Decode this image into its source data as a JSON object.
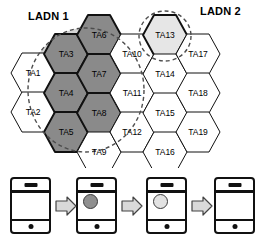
{
  "figure": {
    "type": "cellular-tracking-area-diagram",
    "ladn_labels": [
      {
        "id": "ladn1",
        "text": "LADN 1"
      },
      {
        "id": "ladn2",
        "text": "LADN 2"
      }
    ],
    "colors": {
      "ladn1_fill": "#8a8a8a",
      "ladn2_fill": "#e6e6e6",
      "hex_stroke": "#111111",
      "hex_fill": "#ffffff",
      "dashed_stroke": "#555555",
      "arrow_fill": "#d9d9d9",
      "arrow_stroke": "#444444"
    },
    "hexagons": [
      {
        "label": "TA1",
        "cx": 33,
        "cy": 73,
        "fill": "white",
        "bold": false
      },
      {
        "label": "TA2",
        "cx": 33,
        "cy": 112,
        "fill": "white",
        "bold": false
      },
      {
        "label": "TA3",
        "cx": 66,
        "cy": 54,
        "fill": "ladn1",
        "bold": true
      },
      {
        "label": "TA4",
        "cx": 66,
        "cy": 93,
        "fill": "ladn1",
        "bold": true
      },
      {
        "label": "TA5",
        "cx": 66,
        "cy": 132,
        "fill": "ladn1",
        "bold": true
      },
      {
        "label": "TA6",
        "cx": 99,
        "cy": 35,
        "fill": "ladn1",
        "bold": true
      },
      {
        "label": "TA7",
        "cx": 99,
        "cy": 74,
        "fill": "ladn1",
        "bold": true
      },
      {
        "label": "TA8",
        "cx": 99,
        "cy": 113,
        "fill": "ladn1",
        "bold": true
      },
      {
        "label": "TA9",
        "cx": 99,
        "cy": 152,
        "fill": "white",
        "bold": false
      },
      {
        "label": "TA10",
        "cx": 132,
        "cy": 54,
        "fill": "white",
        "bold": false
      },
      {
        "label": "TA11",
        "cx": 132,
        "cy": 93,
        "fill": "white",
        "bold": false
      },
      {
        "label": "TA12",
        "cx": 132,
        "cy": 132,
        "fill": "white",
        "bold": false
      },
      {
        "label": "TA13",
        "cx": 165,
        "cy": 35,
        "fill": "ladn2",
        "bold": true
      },
      {
        "label": "TA14",
        "cx": 165,
        "cy": 74,
        "fill": "white",
        "bold": false
      },
      {
        "label": "TA15",
        "cx": 165,
        "cy": 113,
        "fill": "white",
        "bold": false
      },
      {
        "label": "TA16",
        "cx": 165,
        "cy": 152,
        "fill": "white",
        "bold": false
      },
      {
        "label": "TA17",
        "cx": 198,
        "cy": 54,
        "fill": "white",
        "bold": false
      },
      {
        "label": "TA18",
        "cx": 198,
        "cy": 93,
        "fill": "white",
        "bold": false
      },
      {
        "label": "TA19",
        "cx": 198,
        "cy": 132,
        "fill": "white",
        "bold": false
      }
    ],
    "ladn_regions": [
      {
        "id": "ladn1-region",
        "shape": "ellipse",
        "cx": 86,
        "cy": 90,
        "rx": 58,
        "ry": 62,
        "covers": [
          "TA3",
          "TA4",
          "TA5",
          "TA6",
          "TA7",
          "TA8"
        ]
      },
      {
        "id": "ladn2-region",
        "shape": "ellipse",
        "cx": 165,
        "cy": 36,
        "rx": 26,
        "ry": 25,
        "covers": [
          "TA13"
        ]
      }
    ],
    "phone_sequence": {
      "steps": [
        {
          "id": "phone-1",
          "state": "no-session",
          "blob": null
        },
        {
          "id": "phone-2",
          "state": "ladn1-session",
          "blob": "dark"
        },
        {
          "id": "phone-3",
          "state": "ladn2-session",
          "blob": "light"
        },
        {
          "id": "phone-4",
          "state": "no-session",
          "blob": null
        }
      ],
      "arrow_count": 3,
      "arrow_glyph": "right-arrow"
    }
  }
}
